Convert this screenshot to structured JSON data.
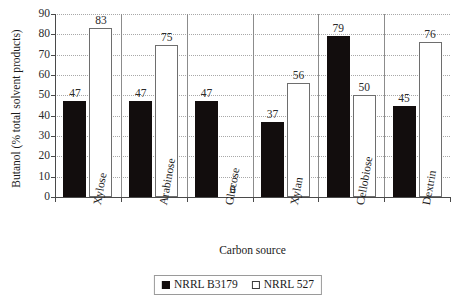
{
  "chart_data": {
    "type": "bar",
    "title": "",
    "subtitle": "",
    "xlabel": "Carbon source",
    "ylabel": "Butanol (% total solvent products)",
    "categories": [
      "Xylose",
      "Arabinose",
      "Glucose",
      "Xylan",
      "Cellobiose",
      "Dextrin"
    ],
    "series": [
      {
        "name": "NRRL B3179",
        "color": "#120d0d",
        "style": "filled",
        "values": [
          47,
          47,
          47,
          37,
          79,
          45
        ]
      },
      {
        "name": "NRRL 527",
        "color": "#ffffff",
        "style": "hollow",
        "values": [
          83,
          75,
          0,
          56,
          50,
          76
        ]
      }
    ],
    "data_labels": [
      [
        "47",
        "47",
        "47",
        "37",
        "79",
        "45"
      ],
      [
        "83",
        "75",
        "0",
        "56",
        "50",
        "76"
      ]
    ],
    "ylim": [
      0,
      90
    ],
    "yticks": [
      0,
      10,
      20,
      30,
      40,
      50,
      60,
      70,
      80,
      90
    ],
    "ytick_labels": [
      "0",
      "10",
      "20",
      "30",
      "40",
      "50",
      "60",
      "70",
      "80",
      "90"
    ],
    "grid": "horizontal-dotted",
    "legend_position": "bottom-center",
    "legend": [
      "NRRL B3179",
      "NRRL 527"
    ]
  }
}
